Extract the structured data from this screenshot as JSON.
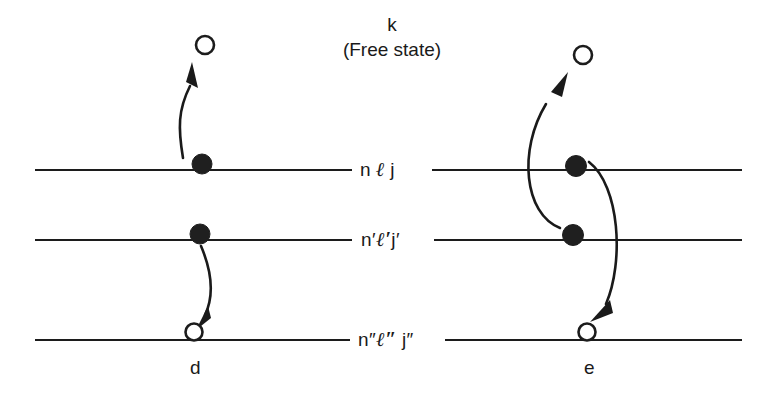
{
  "figure": {
    "free_state": {
      "symbol": "k",
      "caption": "(Free state)"
    },
    "levels": [
      {
        "id": "level-n-l-j",
        "label_n": "n",
        "label_l": "ℓ",
        "label_j": "j",
        "y": 170
      },
      {
        "id": "level-np-lp-jp",
        "label_n": "n′",
        "label_l": "ℓ′",
        "label_j": "j′",
        "y": 240
      },
      {
        "id": "level-npp-lpp-jpp",
        "label_n": "n″",
        "label_l": "ℓ″",
        "label_j": "j″",
        "y": 340
      }
    ],
    "panels": [
      {
        "id": "panel-d",
        "letter": "d",
        "particles": [
          {
            "kind": "electron",
            "level": "n ℓ j",
            "cx": 202,
            "cy": 164
          },
          {
            "kind": "electron",
            "level": "n′ℓ′j′",
            "cx": 200,
            "cy": 234
          },
          {
            "kind": "hole",
            "level": "n″ℓ″j″",
            "cx": 194,
            "cy": 332
          },
          {
            "kind": "free",
            "level": "k",
            "cx": 205,
            "cy": 45
          }
        ],
        "transitions": [
          {
            "from": "n ℓ j",
            "to": "k",
            "direction": "up"
          },
          {
            "from": "n′ℓ′j′",
            "to": "n″ℓ″j″",
            "direction": "down"
          }
        ]
      },
      {
        "id": "panel-e",
        "letter": "e",
        "particles": [
          {
            "kind": "electron",
            "level": "n ℓ j",
            "cx": 576,
            "cy": 166
          },
          {
            "kind": "electron",
            "level": "n′ℓ′j′",
            "cx": 573,
            "cy": 235
          },
          {
            "kind": "hole",
            "level": "n″ℓ″j″",
            "cx": 587,
            "cy": 332
          },
          {
            "kind": "free",
            "level": "k",
            "cx": 583,
            "cy": 55
          }
        ],
        "transitions": [
          {
            "from": "n′ℓ′j′",
            "to": "k",
            "direction": "up"
          },
          {
            "from": "n ℓ j",
            "to": "n″ℓ″j″",
            "direction": "down"
          }
        ]
      }
    ]
  }
}
